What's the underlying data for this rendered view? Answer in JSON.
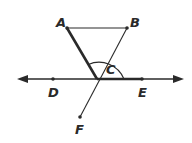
{
  "diagram": {
    "type": "geometry",
    "points": {
      "A": {
        "label": "A",
        "x": 67,
        "y": 28
      },
      "B": {
        "label": "B",
        "x": 127,
        "y": 28
      },
      "C": {
        "label": "C",
        "x": 97,
        "y": 79
      },
      "D": {
        "label": "D",
        "x": 53,
        "y": 79
      },
      "E": {
        "label": "E",
        "x": 142,
        "y": 79
      },
      "F": {
        "label": "F",
        "x": 80,
        "y": 117
      }
    },
    "segments": [
      {
        "from": "A",
        "to": "B",
        "weight": "thin"
      },
      {
        "from": "A",
        "to": "C",
        "weight": "bold"
      },
      {
        "from": "B",
        "to": "F",
        "weight": "thin"
      },
      {
        "from": "C",
        "to": "E",
        "weight": "bold"
      }
    ],
    "line": {
      "through": [
        "D",
        "E"
      ],
      "arrows": "both"
    },
    "angle_arc": {
      "vertex": "C",
      "from": "A",
      "to": "E",
      "label": "C"
    },
    "colors": {
      "stroke": "#2a2a2a",
      "background": "#ffffff"
    }
  }
}
